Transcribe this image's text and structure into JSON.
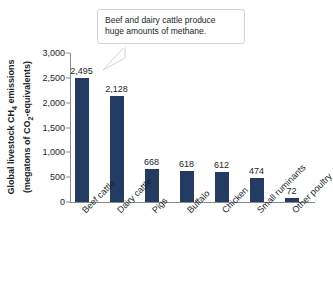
{
  "chart_data": {
    "type": "bar",
    "title": "",
    "xlabel": "",
    "ylabel": "Global livestock CH4 emissions (megatons of CO2-equivalents)",
    "ylim": [
      0,
      3000
    ],
    "grid": false,
    "legend": "none",
    "categories": [
      "Beef cattle",
      "Dairy cattle",
      "Pigs",
      "Buffalo",
      "Chicken",
      "Small ruminants",
      "Other poultry"
    ],
    "values": [
      2495,
      2128,
      668,
      618,
      612,
      474,
      72
    ],
    "value_labels": [
      "2,495",
      "2,128",
      "668",
      "618",
      "612",
      "474",
      "72"
    ],
    "ytick_values": [
      0,
      500,
      1000,
      1500,
      2000,
      2500,
      3000
    ],
    "ytick_labels": [
      "0",
      "500",
      "1,000",
      "1,500",
      "2,000",
      "2,500",
      "3,000"
    ],
    "bar_color": "#243b63",
    "axis_color": "#8a8a8a",
    "text_color": "#221f1f"
  },
  "axis_title": {
    "line1_pre": "Global livestock CH",
    "line1_sub": "4",
    "line1_post": " emissions",
    "line2_pre": "(megatons of CO",
    "line2_sub": "2",
    "line2_post": "-equivalents)"
  },
  "callout": {
    "line1": "Beef and dairy cattle produce",
    "line2": "huge amounts of methane."
  }
}
